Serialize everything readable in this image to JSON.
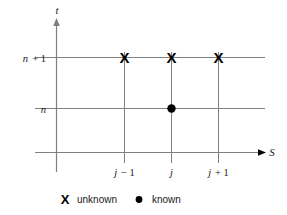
{
  "figure": {
    "type": "finite-difference-stencil",
    "axes": {
      "x_axis_label": "S",
      "y_axis_label": "t"
    },
    "y_ticks": [
      {
        "label_prefix": "n",
        "label_suffix": "+ 1",
        "value": "n+1"
      },
      {
        "label_prefix": "n",
        "label_suffix": "",
        "value": "n"
      }
    ],
    "x_ticks": [
      {
        "label_prefix": "j",
        "label_suffix": "− 1",
        "value": "j-1"
      },
      {
        "label_prefix": "j",
        "label_suffix": "",
        "value": "j"
      },
      {
        "label_prefix": "j",
        "label_suffix": "+ 1",
        "value": "j+1"
      }
    ],
    "markers": {
      "unknown_glyph": "X",
      "known_glyph": "●",
      "unknown_points": [
        {
          "x": "j-1",
          "y": "n+1"
        },
        {
          "x": "j",
          "y": "n+1"
        },
        {
          "x": "j+1",
          "y": "n+1"
        }
      ],
      "known_points": [
        {
          "x": "j",
          "y": "n"
        }
      ]
    },
    "legend": {
      "unknown_symbol": "X",
      "unknown_label": "unknown",
      "known_symbol": "●",
      "known_label": "known"
    },
    "colors": {
      "grid": "#808080",
      "marker": "#000000",
      "text": "#1a1a1a",
      "background": "#ffffff"
    }
  }
}
